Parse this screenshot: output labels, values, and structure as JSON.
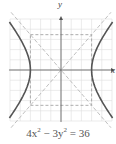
{
  "chart_data": {
    "type": "line",
    "title": "",
    "caption": "4x² − 3y² = 36",
    "equation": {
      "a2": 9,
      "b2": 12,
      "form": "4x^2 - 3y^2 = 36"
    },
    "xlabel": "x",
    "ylabel": "y",
    "xlim": [
      -5,
      5
    ],
    "ylim": [
      -5,
      5
    ],
    "grid": true,
    "grid_step": 1,
    "series": [
      {
        "name": "hyperbola-right-branch",
        "style": "solid",
        "color": "#555555",
        "x": [
          3,
          3.5,
          4,
          4.5,
          5
        ],
        "y_pos": [
          0,
          2.08,
          3.06,
          3.87,
          4.47
        ]
      },
      {
        "name": "hyperbola-left-branch",
        "style": "solid",
        "color": "#555555",
        "x": [
          -3,
          -3.5,
          -4,
          -4.5,
          -5
        ],
        "y_pos": [
          0,
          2.08,
          3.06,
          3.87,
          4.47
        ]
      },
      {
        "name": "asymptote-positive",
        "style": "dashed",
        "color": "#aaaaaa",
        "slope": 1.1547
      },
      {
        "name": "asymptote-negative",
        "style": "dashed",
        "color": "#aaaaaa",
        "slope": -1.1547
      },
      {
        "name": "fundamental-rectangle",
        "style": "dashed",
        "color": "#999999",
        "x_range": [
          -3,
          3
        ],
        "y_range": [
          -3.46,
          3.46
        ]
      }
    ],
    "vertices": [
      [
        -3,
        0
      ],
      [
        3,
        0
      ]
    ]
  },
  "labels": {
    "x_axis": "x",
    "y_axis": "y",
    "caption_parts": {
      "a": "4x",
      "exp1": "2",
      "b": " − 3y",
      "exp2": "2",
      "c": " = 36"
    }
  },
  "colors": {
    "grid": "#dddddd",
    "axis": "#555555",
    "curve": "#555555",
    "asymptote": "#b0b0b0",
    "rectangle": "#999999"
  }
}
